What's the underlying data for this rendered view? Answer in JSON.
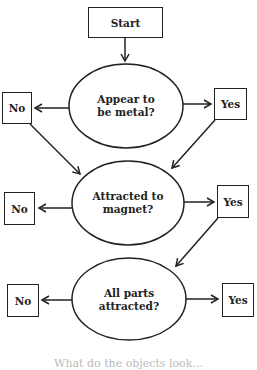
{
  "flowchart": {
    "start": {
      "label": "Start"
    },
    "decisions": [
      {
        "question_line1": "Appear to",
        "question_line2": "be metal?",
        "no_label": "No",
        "yes_label": "Yes"
      },
      {
        "question_line1": "Attracted to",
        "question_line2": "magnet?",
        "no_label": "No",
        "yes_label": "Yes"
      },
      {
        "question_line1": "All parts",
        "question_line2": "attracted?",
        "no_label": "No",
        "yes_label": "Yes"
      }
    ]
  },
  "caption": "What do the objects look..."
}
